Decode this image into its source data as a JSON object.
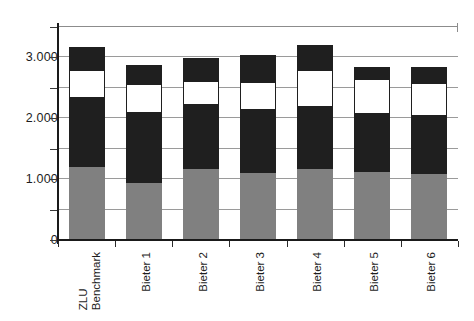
{
  "chart_data": {
    "type": "bar",
    "subtype": "stacked-bar",
    "title": "",
    "xlabel": "",
    "ylabel": "",
    "ylim": [
      0,
      3500
    ],
    "yticks": [
      0,
      1000,
      2000,
      3000
    ],
    "ytick_labels": [
      "0",
      "1.000",
      "2.000",
      "3.000"
    ],
    "minor_tick_interval": 500,
    "grid": true,
    "grid_axis": "y",
    "legend": "none",
    "categories": [
      "ZLU Benchmark",
      "Bieter 1",
      "Bieter 2",
      "Bieter 3",
      "Bieter 4",
      "Bieter 5",
      "Bieter 6"
    ],
    "category_lines": [
      [
        "ZLU",
        "Benchmark"
      ],
      [
        "Bieter 1"
      ],
      [
        "Bieter 2"
      ],
      [
        "Bieter 3"
      ],
      [
        "Bieter 4"
      ],
      [
        "Bieter 5"
      ],
      [
        "Bieter 6"
      ]
    ],
    "series": [
      {
        "name": "segment-1",
        "color": "#808080",
        "values": [
          1200,
          930,
          1160,
          1100,
          1160,
          1110,
          1090
        ]
      },
      {
        "name": "segment-2",
        "color": "#1f1f1f",
        "values": [
          1130,
          1150,
          1060,
          1040,
          1020,
          960,
          940
        ]
      },
      {
        "name": "segment-3",
        "color": "#ffffff",
        "values": [
          470,
          480,
          390,
          450,
          620,
          580,
          550
        ]
      },
      {
        "name": "segment-4",
        "color": "#1f1f1f",
        "values": [
          30,
          0,
          40,
          30,
          0,
          0,
          40
        ]
      },
      {
        "name": "segment-5",
        "color": "#1f1f1f",
        "values": [
          340,
          320,
          340,
          420,
          410,
          200,
          220
        ]
      }
    ],
    "totals": [
      3170,
      2880,
      2990,
      3040,
      3210,
      2850,
      2840
    ]
  }
}
